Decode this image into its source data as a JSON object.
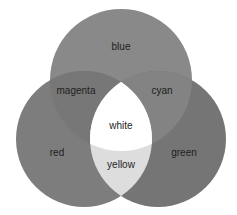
{
  "diagram": {
    "type": "venn-3",
    "circles": [
      {
        "name": "blue",
        "cx": 121,
        "cy": 80,
        "r": 71
      },
      {
        "name": "red",
        "cx": 84,
        "cy": 139,
        "r": 68
      },
      {
        "name": "green",
        "cx": 158,
        "cy": 139,
        "r": 68
      }
    ],
    "colors": {
      "background": "#ffffff",
      "blue": "#898989",
      "red": "#7d7d7d",
      "green": "#757575",
      "magenta": "#777777",
      "cyan": "#838383",
      "yellow": "#dddddd",
      "white": "#ffffff"
    },
    "labels": {
      "blue": "blue",
      "magenta": "magenta",
      "cyan": "cyan",
      "white": "white",
      "red": "red",
      "yellow": "yellow",
      "green": "green"
    }
  }
}
